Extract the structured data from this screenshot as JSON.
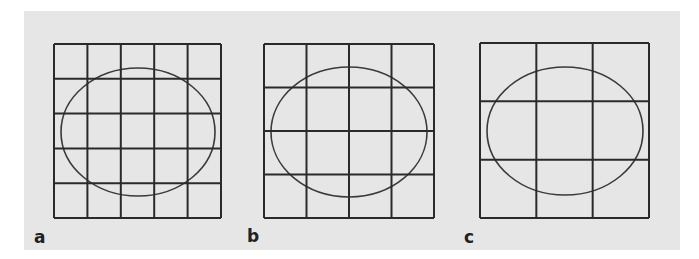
{
  "figure": {
    "background_color": "#e6e6e6",
    "line_color": "#2a2a2a",
    "ellipse_color": "#3a3a3a",
    "panels": [
      {
        "label": "a",
        "grid_divisions": 5,
        "grid": {
          "x": 54,
          "y": 44,
          "w": 167,
          "h": 174
        },
        "ellipse": {
          "cx": 138,
          "cy": 132,
          "rx": 77,
          "ry": 64
        }
      },
      {
        "label": "b",
        "grid_divisions": 4,
        "grid": {
          "x": 264,
          "y": 44,
          "w": 170,
          "h": 174
        },
        "ellipse": {
          "cx": 349,
          "cy": 132,
          "rx": 78,
          "ry": 65
        }
      },
      {
        "label": "c",
        "grid_divisions": 3,
        "grid": {
          "x": 480,
          "y": 43,
          "w": 169,
          "h": 175
        },
        "ellipse": {
          "cx": 565,
          "cy": 131,
          "rx": 78,
          "ry": 64
        }
      }
    ]
  }
}
